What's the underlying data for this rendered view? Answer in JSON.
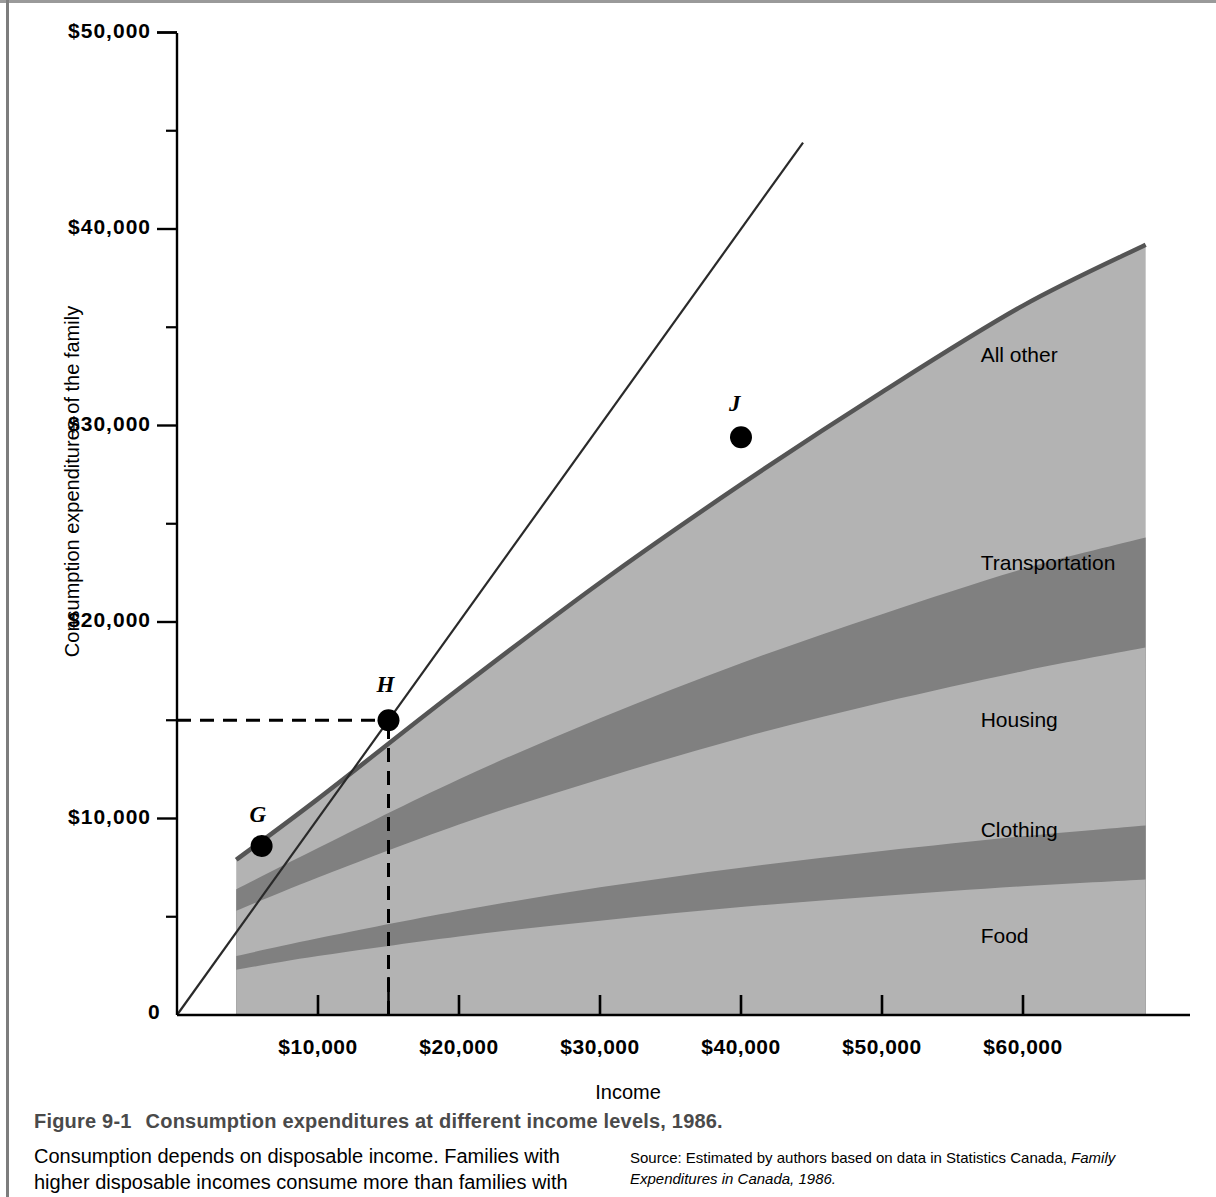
{
  "figure": {
    "number": "Figure 9-1",
    "title": "Consumption expenditures at different income levels, 1986.",
    "body_text": "Consumption depends on disposable income. Families with higher disposable incomes consume more than families with",
    "source_prefix": "Source: Estimated by authors based on data in Statistics Canada, ",
    "source_italic": "Family Expenditures in Canada, 1986."
  },
  "chart_data": {
    "type": "area",
    "title": "Consumption expenditures at different income levels, 1986.",
    "xlabel": "Income",
    "ylabel": "Consumption expenditures of the family",
    "xlim": [
      0,
      68700
    ],
    "ylim": [
      0,
      50000
    ],
    "x_major_ticks": [
      10000,
      20000,
      30000,
      40000,
      50000,
      60000
    ],
    "x_major_tick_labels": [
      "$10,000",
      "$20,000",
      "$30,000",
      "$40,000",
      "$50,000",
      "$60,000"
    ],
    "x_minor_ticks": [
      15000
    ],
    "y_major_ticks": [
      10000,
      20000,
      30000,
      40000,
      50000
    ],
    "y_major_tick_labels": [
      "$10,000",
      "$20,000",
      "$30,000",
      "$40,000",
      "$50,000"
    ],
    "y_minor_ticks": [
      5000,
      15000,
      25000,
      35000,
      45000
    ],
    "origin_label": "0",
    "grid": false,
    "legend": "inline-band-labels",
    "x_data": [
      4200,
      10000,
      20000,
      30000,
      40000,
      50000,
      60000,
      68700
    ],
    "series": [
      {
        "name": "Food",
        "color": "#b3b3b3",
        "cumulative_top": [
          2300,
          3000,
          4000,
          4800,
          5500,
          6050,
          6550,
          6900
        ]
      },
      {
        "name": "Clothing",
        "color": "#808080",
        "cumulative_top": [
          3000,
          3900,
          5300,
          6500,
          7500,
          8350,
          9100,
          9650
        ]
      },
      {
        "name": "Housing",
        "color": "#b3b3b3",
        "cumulative_top": [
          5300,
          7000,
          9700,
          12000,
          14100,
          15900,
          17500,
          18700
        ]
      },
      {
        "name": "Transportation",
        "color": "#808080",
        "cumulative_top": [
          6400,
          8500,
          12000,
          15100,
          17900,
          20400,
          22700,
          24300
        ]
      },
      {
        "name": "All other",
        "color": "#b3b3b3",
        "cumulative_top": [
          7900,
          11000,
          16600,
          22000,
          27000,
          31700,
          36100,
          39200
        ]
      }
    ],
    "total_consumption_curve": {
      "name": "Total consumption",
      "x": [
        4200,
        10000,
        20000,
        30000,
        40000,
        50000,
        60000,
        68700
      ],
      "y": [
        7900,
        11000,
        16600,
        22000,
        27000,
        31700,
        36100,
        39200
      ]
    },
    "reference_line": {
      "name": "45-degree line",
      "description": "Consumption equals income",
      "x": [
        0,
        44400
      ],
      "y": [
        0,
        44400
      ]
    },
    "band_labels": [
      {
        "name": "All other",
        "x": 57000,
        "y": 33500
      },
      {
        "name": "Transportation",
        "x": 57000,
        "y": 22900
      },
      {
        "name": "Housing",
        "x": 57000,
        "y": 14900
      },
      {
        "name": "Clothing",
        "x": 57000,
        "y": 9300
      },
      {
        "name": "Food",
        "x": 57000,
        "y": 3900
      }
    ],
    "annotated_points": [
      {
        "label": "G",
        "x": 6000,
        "y": 8600,
        "label_dx": -6,
        "label_dy": -30
      },
      {
        "label": "H",
        "x": 15000,
        "y": 15000,
        "label_dx": -6,
        "label_dy": -34
      },
      {
        "label": "J",
        "x": 40000,
        "y": 29400,
        "label_dx": -6,
        "label_dy": -32
      }
    ],
    "guide_lines": [
      {
        "name": "H-horizontal-dashed",
        "from": [
          0,
          15000
        ],
        "to": [
          15000,
          15000
        ],
        "style": "dashed"
      },
      {
        "name": "H-vertical-dashed",
        "from": [
          15000,
          0
        ],
        "to": [
          15000,
          15000
        ],
        "style": "dashed"
      }
    ]
  }
}
